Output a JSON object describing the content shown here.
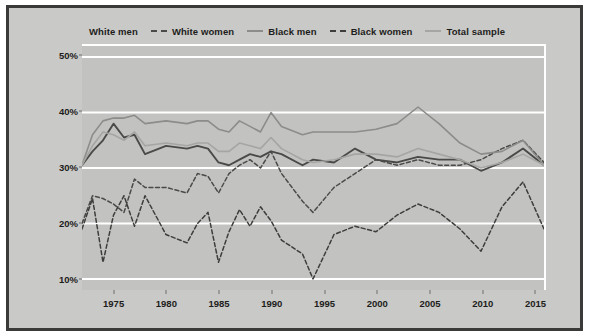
{
  "legend": {
    "items": [
      {
        "label": "White men",
        "style": "none",
        "color": "#4a4a48"
      },
      {
        "label": "White women",
        "style": "dash",
        "color": "#4a4a48"
      },
      {
        "label": "Black men",
        "style": "solid",
        "color": "#8c8c8a"
      },
      {
        "label": "Black women",
        "style": "dash",
        "color": "#3d3d3b"
      },
      {
        "label": "Total sample",
        "style": "solid",
        "color": "#a5a5a3"
      }
    ]
  },
  "axes": {
    "ylabel": "Percentage of Americans who respond \"very happy\"",
    "yticks": [
      "10%",
      "20%",
      "30%",
      "40%",
      "50%"
    ],
    "xticks": [
      "1975",
      "1980",
      "1985",
      "1990",
      "1995",
      "2000",
      "2005",
      "2010",
      "2015"
    ]
  },
  "colors": {
    "panel": "#c2c2c0",
    "canvas": "#c9c9c7",
    "frame": "#3a3a38",
    "grid": "#ffffff",
    "white_men": "#4a4a48",
    "white_women": "#4a4a48",
    "black_men": "#8c8c8a",
    "black_women": "#3d3d3b",
    "total_sample": "#a5a5a3"
  },
  "chart_data": {
    "type": "line",
    "title": "",
    "xlabel": "",
    "ylabel": "Percentage of Americans who respond \"very happy\"",
    "xlim": [
      1972,
      2016
    ],
    "ylim": [
      8,
      52
    ],
    "yticks": [
      10,
      20,
      30,
      40,
      50
    ],
    "xticks": [
      1975,
      1980,
      1985,
      1990,
      1995,
      2000,
      2005,
      2010,
      2015
    ],
    "grid": "horizontal-white",
    "legend_position": "top-center",
    "x": [
      1972,
      1973,
      1974,
      1975,
      1976,
      1977,
      1978,
      1980,
      1982,
      1983,
      1984,
      1985,
      1986,
      1987,
      1988,
      1989,
      1990,
      1991,
      1993,
      1994,
      1996,
      1998,
      2000,
      2002,
      2004,
      2006,
      2008,
      2010,
      2012,
      2014,
      2016
    ],
    "series": [
      {
        "name": "White men",
        "style": "solid",
        "color": "#4a4a48",
        "width": 1.9,
        "values": [
          30.5,
          33.0,
          35.0,
          38.0,
          35.5,
          36.0,
          32.5,
          34.0,
          33.5,
          34.0,
          33.5,
          31.0,
          30.5,
          31.5,
          32.5,
          32.0,
          33.0,
          32.5,
          30.5,
          31.5,
          31.0,
          33.5,
          31.5,
          31.0,
          32.0,
          31.5,
          31.5,
          29.5,
          31.0,
          33.5,
          30.5
        ]
      },
      {
        "name": "White women",
        "style": "dashed",
        "color": "#4a4a48",
        "width": 1.5,
        "values": [
          20.0,
          25.0,
          24.5,
          23.5,
          22.0,
          28.0,
          26.5,
          26.5,
          25.5,
          29.0,
          28.5,
          25.5,
          29.0,
          30.5,
          31.5,
          30.0,
          33.0,
          29.0,
          24.0,
          22.0,
          26.5,
          29.0,
          31.5,
          30.5,
          31.5,
          30.5,
          30.5,
          31.5,
          33.5,
          35.0,
          31.0
        ]
      },
      {
        "name": "Black men",
        "style": "solid",
        "color": "#8c8c8a",
        "width": 1.6,
        "values": [
          30.5,
          36.0,
          38.5,
          39.0,
          39.0,
          39.5,
          38.0,
          38.5,
          38.0,
          38.5,
          38.5,
          37.0,
          36.5,
          38.5,
          37.5,
          36.5,
          40.0,
          37.5,
          36.0,
          36.5,
          36.5,
          36.5,
          37.0,
          38.0,
          41.0,
          38.0,
          34.5,
          32.5,
          33.0,
          35.0,
          30.5
        ]
      },
      {
        "name": "Black women",
        "style": "dashed",
        "color": "#3d3d3b",
        "width": 1.5,
        "values": [
          19.0,
          24.5,
          13.0,
          21.5,
          25.0,
          19.5,
          25.0,
          18.0,
          16.5,
          20.0,
          22.0,
          13.0,
          18.5,
          22.5,
          19.5,
          23.0,
          20.5,
          17.0,
          14.5,
          10.0,
          18.0,
          19.5,
          18.5,
          21.5,
          23.5,
          22.0,
          19.0,
          15.0,
          23.0,
          27.5,
          19.0
        ]
      },
      {
        "name": "Total sample",
        "style": "solid",
        "color": "#a5a5a3",
        "width": 1.6,
        "values": [
          30.5,
          34.0,
          36.5,
          36.0,
          35.0,
          36.5,
          34.0,
          34.5,
          34.0,
          34.5,
          34.5,
          33.0,
          33.0,
          34.5,
          34.0,
          33.5,
          35.5,
          33.5,
          31.5,
          31.0,
          31.5,
          32.5,
          32.5,
          32.0,
          33.5,
          32.5,
          31.5,
          30.0,
          31.0,
          32.5,
          30.5
        ]
      }
    ]
  }
}
